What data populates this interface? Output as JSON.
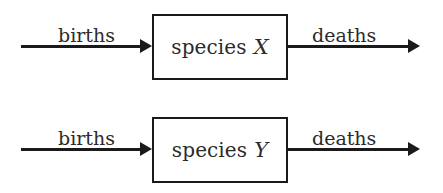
{
  "diagram": {
    "background_color": "#ffffff",
    "line_color": "#1a1a1a",
    "text_color": "#2b2b2b",
    "rows": [
      {
        "id": "species-x",
        "box_label_word": "species",
        "box_label_variable": "X",
        "inflow_label": "births",
        "outflow_label": "deaths"
      },
      {
        "id": "species-y",
        "box_label_word": "species",
        "box_label_variable": "Y",
        "inflow_label": "births",
        "outflow_label": "deaths"
      }
    ]
  }
}
